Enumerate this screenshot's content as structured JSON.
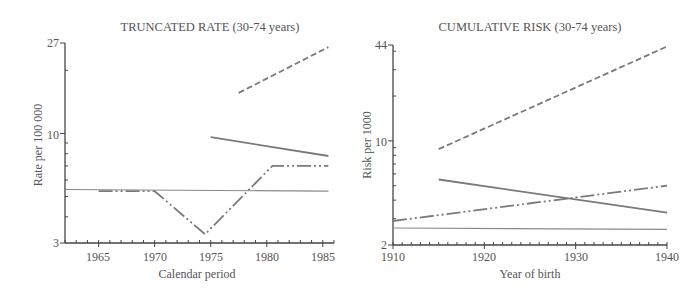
{
  "chart_data": [
    {
      "type": "line",
      "title": "TRUNCATED RATE (30-74 years)",
      "xlabel": "Calendar period",
      "ylabel": "Rate per 100 000",
      "yscale": "log",
      "ylim": [
        3,
        27
      ],
      "xlim": [
        1962,
        1986
      ],
      "x_ticks": [
        "1965",
        "1970",
        "1975",
        "1980",
        "1985"
      ],
      "y_ticks": [
        "3",
        "10",
        "27"
      ],
      "grid": false,
      "legend": "none",
      "series": [
        {
          "name": "dashed",
          "style": "dashed",
          "color": "#7a7a7a",
          "x": [
            1977.5,
            1985.5
          ],
          "values": [
            15.6,
            25.8
          ]
        },
        {
          "name": "solid-thick",
          "style": "solid",
          "color": "#7a7a7a",
          "x": [
            1975,
            1985.5
          ],
          "values": [
            9.6,
            7.8
          ]
        },
        {
          "name": "dash-dot-dot",
          "style": "dash-dot-dot",
          "color": "#7a7a7a",
          "x": [
            1965,
            1970,
            1974.5,
            1980.5,
            1985.5
          ],
          "values": [
            5.3,
            5.3,
            3.3,
            7.0,
            7.0
          ]
        },
        {
          "name": "solid-thin",
          "style": "solid-thin",
          "color": "#8a8a8a",
          "x": [
            1962,
            1985.5
          ],
          "values": [
            5.4,
            5.3
          ]
        }
      ]
    },
    {
      "type": "line",
      "title": "CUMULATIVE RISK (30-74 years)",
      "xlabel": "Year of birth",
      "ylabel": "Risk per 1000",
      "yscale": "log",
      "ylim": [
        2,
        44
      ],
      "xlim": [
        1910,
        1940
      ],
      "x_ticks": [
        "1910",
        "1920",
        "1930",
        "1940"
      ],
      "y_ticks": [
        "2",
        "10",
        "44"
      ],
      "grid": false,
      "legend": "none",
      "series": [
        {
          "name": "dashed",
          "style": "dashed",
          "color": "#7a7a7a",
          "x": [
            1915,
            1940
          ],
          "values": [
            8.8,
            43
          ]
        },
        {
          "name": "solid-thick",
          "style": "solid",
          "color": "#7a7a7a",
          "x": [
            1915,
            1940
          ],
          "values": [
            5.5,
            3.3
          ]
        },
        {
          "name": "dash-dot-dot",
          "style": "dash-dot-dot",
          "color": "#7a7a7a",
          "x": [
            1910,
            1940
          ],
          "values": [
            2.9,
            5.0
          ]
        },
        {
          "name": "solid-thin",
          "style": "solid-thin",
          "color": "#8a8a8a",
          "x": [
            1910,
            1940
          ],
          "values": [
            2.6,
            2.55
          ]
        }
      ]
    }
  ]
}
